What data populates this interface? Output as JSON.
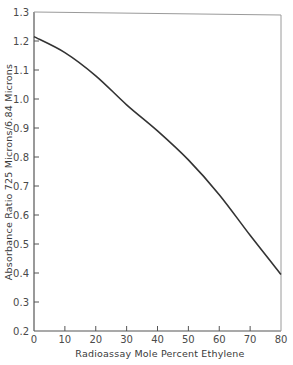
{
  "chart_data": {
    "type": "line",
    "title": "",
    "xlabel": "Radioassay Mole Percent Ethylene",
    "ylabel": "Absorbance Ratio 725 Microns/6.84 Microns",
    "xlim": [
      0,
      80
    ],
    "ylim": [
      0.2,
      1.3
    ],
    "grid": false,
    "legend": null,
    "x_ticks": [
      0,
      10,
      20,
      30,
      40,
      50,
      60,
      70,
      80
    ],
    "x_tick_labels": [
      "0",
      "10",
      "20",
      "30",
      "40",
      "50",
      "60",
      "70",
      "80"
    ],
    "y_ticks": [
      0.2,
      0.3,
      0.4,
      0.5,
      0.6,
      0.7,
      0.8,
      0.9,
      1.0,
      1.1,
      1.2,
      1.3
    ],
    "y_tick_labels": [
      "0.2",
      "0.3",
      "0.4",
      "0.5",
      "0.6",
      "0.7",
      "0.8",
      "0.9",
      "1.0",
      "1.1",
      "1.2",
      "1.3"
    ],
    "series": [
      {
        "name": "Absorbance ratio",
        "color": "#333333",
        "x": [
          0,
          10,
          20,
          30,
          40,
          50,
          60,
          70,
          80
        ],
        "y": [
          1.215,
          1.16,
          1.08,
          0.98,
          0.89,
          0.79,
          0.67,
          0.53,
          0.395
        ]
      }
    ]
  }
}
